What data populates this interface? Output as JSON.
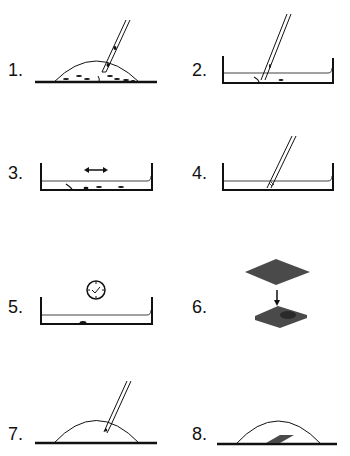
{
  "steps": [
    {
      "number": "1.",
      "description": "droplet with dispersed particles, pipette tip picking"
    },
    {
      "number": "2.",
      "description": "dish with liquid and particles, pipette"
    },
    {
      "number": "3.",
      "description": "dish with particles, horizontal agitation arrow"
    },
    {
      "number": "4.",
      "description": "dish with liquid, pipette transfer"
    },
    {
      "number": "5.",
      "description": "dish with single particle, clock (wait)"
    },
    {
      "number": "6.",
      "description": "grid sheet placed onto sample"
    },
    {
      "number": "7.",
      "description": "droplet with pipette"
    },
    {
      "number": "8.",
      "description": "droplet with grid sheet inside"
    }
  ],
  "colors": {
    "stroke": "#111111",
    "fill_dark": "#4a4a4a",
    "background": "#ffffff"
  }
}
